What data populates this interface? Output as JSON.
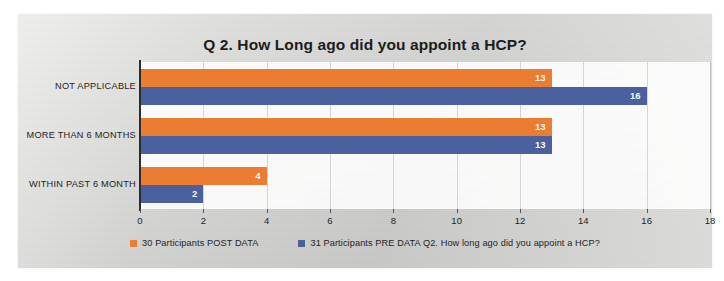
{
  "chart_data": {
    "type": "bar",
    "orientation": "horizontal",
    "title": "Q 2. How Long ago did you appoint a HCP?",
    "xlabel": "",
    "ylabel": "",
    "xlim": [
      0,
      18
    ],
    "xticks": [
      0,
      2,
      4,
      6,
      8,
      10,
      12,
      14,
      16,
      18
    ],
    "grid": true,
    "grid_axis": "x",
    "legend_position": "bottom",
    "categories": [
      "NOT APPLICABLE",
      "MORE THAN 6 MONTHS",
      "WITHIN PAST 6 MONTH"
    ],
    "series": [
      {
        "name": "30 Participants POST DATA",
        "color": "#ED7D31",
        "values": [
          13,
          13,
          4
        ]
      },
      {
        "name": "31 Participants PRE DATA Q2. How long ago did you appoint a HCP?",
        "color": "#4A5F9E",
        "values": [
          16,
          13,
          2
        ]
      }
    ]
  },
  "colors": {
    "post_series": "#ED7D31",
    "pre_series": "#4A5F9E",
    "axis": "#2a2a2a",
    "paper": "#d6d6d4",
    "plot_background": "#ffffff"
  }
}
